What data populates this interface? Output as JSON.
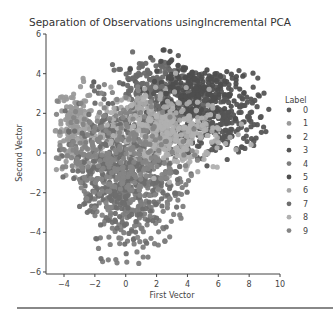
{
  "chart_data": {
    "type": "scatter",
    "title": "Separation of Observations usingIncremental PCA",
    "xlabel": "First Vector",
    "ylabel": "Second Vector",
    "xlim": [
      -5,
      10
    ],
    "ylim": [
      -6,
      6
    ],
    "xticks": [
      -4,
      -2,
      0,
      2,
      4,
      6,
      8,
      10
    ],
    "yticks": [
      -6,
      -4,
      -2,
      0,
      2,
      4,
      6
    ],
    "grid": false,
    "legend": {
      "title": "Label",
      "position": "right",
      "entries": [
        "0",
        "1",
        "2",
        "3",
        "4",
        "5",
        "6",
        "7",
        "8",
        "9"
      ],
      "colors": [
        "#5a5a5a",
        "#9a9a9a",
        "#6a6a6a",
        "#555555",
        "#7d7d7d",
        "#4e4e4e",
        "#a8a8a8",
        "#6e6e6e",
        "#b0b0b0",
        "#858585"
      ]
    },
    "series": [
      {
        "name": "0",
        "color": "#5a5a5a",
        "center": [
          3.5,
          2.2
        ],
        "spread": [
          1.6,
          1.2
        ],
        "count": 260
      },
      {
        "name": "1",
        "color": "#9a9a9a",
        "center": [
          -3.3,
          1.2
        ],
        "spread": [
          0.6,
          1.1
        ],
        "count": 160
      },
      {
        "name": "2",
        "color": "#6a6a6a",
        "center": [
          2.0,
          3.3
        ],
        "spread": [
          1.8,
          0.8
        ],
        "count": 200
      },
      {
        "name": "3",
        "color": "#555555",
        "center": [
          6.0,
          1.8
        ],
        "spread": [
          1.6,
          1.1
        ],
        "count": 240
      },
      {
        "name": "4",
        "color": "#7d7d7d",
        "center": [
          0.5,
          -2.0
        ],
        "spread": [
          1.8,
          1.6
        ],
        "count": 380
      },
      {
        "name": "5",
        "color": "#4e4e4e",
        "center": [
          4.5,
          3.2
        ],
        "spread": [
          1.4,
          0.8
        ],
        "count": 200
      },
      {
        "name": "6",
        "color": "#a8a8a8",
        "center": [
          1.0,
          1.2
        ],
        "spread": [
          2.2,
          1.0
        ],
        "count": 300
      },
      {
        "name": "7",
        "color": "#6e6e6e",
        "center": [
          -0.5,
          -1.0
        ],
        "spread": [
          1.8,
          1.6
        ],
        "count": 380
      },
      {
        "name": "8",
        "color": "#b0b0b0",
        "center": [
          2.5,
          0.8
        ],
        "spread": [
          2.0,
          0.9
        ],
        "count": 200
      },
      {
        "name": "9",
        "color": "#858585",
        "center": [
          -0.5,
          0.0
        ],
        "spread": [
          2.0,
          1.4
        ],
        "count": 280
      }
    ]
  }
}
